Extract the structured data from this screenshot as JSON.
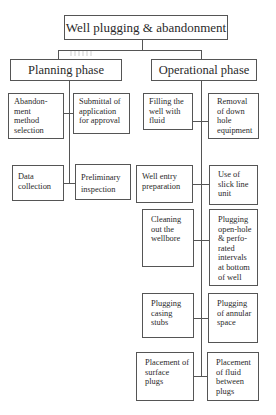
{
  "diagram": {
    "title": "Well plugging & abandonment",
    "phases": [
      {
        "label": "Planning phase",
        "items": [
          "Abandon-\nment\nmethod\nselection",
          "Submittal of\napplication\nfor approval",
          "Data\ncollection",
          "Preliminary\ninspection"
        ]
      },
      {
        "label": "Operational phase",
        "items": [
          "Filling  the\nwell    with\nfluid",
          "Removal\nof down\nhole\nequipment",
          "Well     entry\npreparation",
          "Use of\nslick line\nunit",
          "Cleaning\nout the\nwellbore",
          "Plugging\nopen-hole\n& perfo-\nrated\nintervals\nat bottom\nof well",
          "Plugging\ncasing\nstubs",
          "Plugging\nof annular\nspace",
          "Placement  of\nsurface\nplugs",
          "Placement\nof fluid\nbetween\nplugs"
        ]
      }
    ]
  }
}
